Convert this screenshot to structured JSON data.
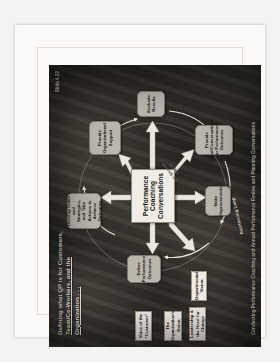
{
  "slide": {
    "title_line1": "Defining what QP is for Customers,",
    "title_line2": "Team/Co-Workers, and the",
    "title_line3": "Organization . . .",
    "slide_number": "Slide  4.22",
    "footer": "Conducting Performance Coaching and Annual Performance Review and Planning Conversations",
    "center": {
      "line1": "Performance",
      "line2": "Coaching",
      "line3": "Conversations",
      "shared_vision": "GP Shared Vision"
    },
    "inputs": [
      {
        "label": "Voice of the “Customer”"
      },
      {
        "label": "The Organization’s Vision"
      },
      {
        "label": "Leadership & the Need for Change"
      },
      {
        "label": "Departmental Vision"
      }
    ],
    "nodes": [
      {
        "id": "define-performance-outcomes",
        "label": "Define Performance Outcomes"
      },
      {
        "id": "develop-goals",
        "label": "Develop Goals and Strategies, and Take Actions to Achieve Outcomes"
      },
      {
        "id": "provide-organizational-support",
        "label": "Provide Organizational Support"
      },
      {
        "id": "evaluate-results",
        "label": "Evaluate Results"
      },
      {
        "id": "provide-input-conversations",
        "label": "Provide Input/Conversations for Performance Outcomes"
      },
      {
        "id": "make-improvements",
        "label": "Make Improvements"
      }
    ],
    "loop_label": "Reinforcing Loop",
    "colors": {
      "background": "#2e2c28",
      "node_fill": "#b9b6ae",
      "input_fill": "#efece4",
      "center_fill": "#f0ede6",
      "arrow": "#e8e5dd"
    }
  }
}
